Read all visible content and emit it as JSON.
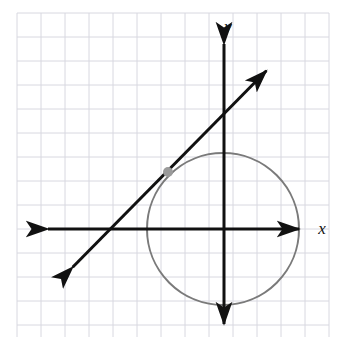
{
  "figure": {
    "background_color": "#ffffff",
    "width": 340,
    "height": 343
  },
  "grid": {
    "name": "graph-paper-grid",
    "color": "#d8d8e0",
    "spacing_px": 24,
    "line_width": 1,
    "x_start": 17,
    "y_start": 13,
    "x_end": 329,
    "y_end": 337
  },
  "axes": {
    "color": "#111111",
    "line_width": 3,
    "origin": {
      "x": 224,
      "y": 229
    },
    "x_axis": {
      "label": "x",
      "label_position": {
        "x": 322,
        "y": 234
      },
      "left_tip": {
        "x": 42,
        "y": 229
      },
      "right_tip": {
        "x": 305,
        "y": 229
      },
      "arrowheads": "both"
    },
    "y_axis": {
      "label": "y",
      "label_position": {
        "x": 228,
        "y": 32
      },
      "top_tip": {
        "x": 224,
        "y": 38
      },
      "bottom_tip": {
        "x": 224,
        "y": 330
      },
      "arrowheads": "both"
    }
  },
  "circle": {
    "name": "circle-curve",
    "color": "#7a7a7a",
    "line_width": 2,
    "center": {
      "x": 223,
      "y": 229
    },
    "radius": 76,
    "radius_units": 3.17
  },
  "line": {
    "name": "secant-line",
    "color": "#111111",
    "line_width": 3,
    "start_tip": {
      "x": 67,
      "y": 273
    },
    "end_tip": {
      "x": 272,
      "y": 65
    },
    "slope": 1.01,
    "arrowheads": "both"
  },
  "point": {
    "name": "marked-point",
    "color": "#9a9a9a",
    "x": 168,
    "y": 172,
    "radius": 5,
    "label": ""
  }
}
